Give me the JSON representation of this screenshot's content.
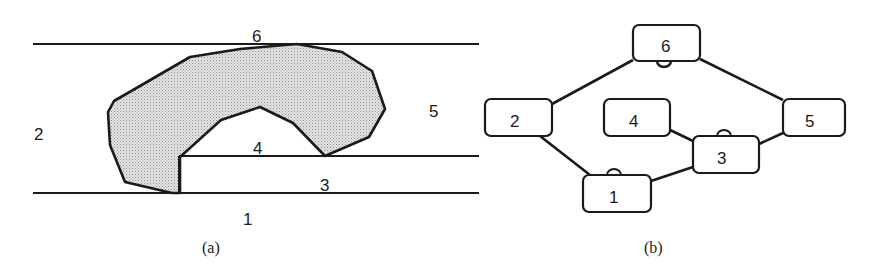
{
  "panel_a": {
    "caption": "(a)",
    "region_labels": {
      "r1": "1",
      "r2": "2",
      "r3": "3",
      "r4": "4",
      "r5": "5",
      "r6": "6"
    },
    "description": "Shaded hook-shaped obstacle spanning regions between horizontal boundary lines"
  },
  "panel_b": {
    "caption": "(b)",
    "nodes": [
      {
        "id": "6",
        "label": "6"
      },
      {
        "id": "2",
        "label": "2"
      },
      {
        "id": "4",
        "label": "4"
      },
      {
        "id": "5",
        "label": "5"
      },
      {
        "id": "3",
        "label": "3"
      },
      {
        "id": "1",
        "label": "1"
      }
    ],
    "edges": [
      [
        "6",
        "2"
      ],
      [
        "6",
        "5"
      ],
      [
        "2",
        "1"
      ],
      [
        "1",
        "3"
      ],
      [
        "4",
        "3"
      ],
      [
        "3",
        "5"
      ]
    ],
    "marked_nodes": [
      "6",
      "3",
      "1"
    ]
  },
  "colors": {
    "stroke": "#1a1a1a",
    "fill_shaded": "#d4d4d4",
    "background": "#ffffff"
  }
}
